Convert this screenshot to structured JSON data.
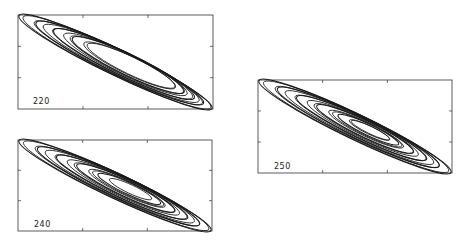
{
  "chart_data": [
    {
      "type": "line",
      "title": "",
      "label": "220",
      "description": "Phase-plane trajectory spiralling inward along a tilted elliptical band (upper-left to lower-right)",
      "xlabel": "",
      "ylabel": "",
      "grid": false,
      "frame": {
        "x": 18,
        "y": 15,
        "w": 195,
        "h": 94
      },
      "loops": 12,
      "inner_loop_fraction": 0.45
    },
    {
      "type": "line",
      "title": "",
      "label": "240",
      "description": "Phase-plane trajectory with nested tilted elliptical loops, tighter core",
      "xlabel": "",
      "ylabel": "",
      "grid": false,
      "frame": {
        "x": 18,
        "y": 140,
        "w": 194,
        "h": 91
      },
      "loops": 14,
      "inner_loop_fraction": 0.25
    },
    {
      "type": "line",
      "title": "",
      "label": "250",
      "description": "Phase-plane trajectory with nested tilted elliptical loops converging to a small central cycle",
      "xlabel": "",
      "ylabel": "",
      "grid": false,
      "frame": {
        "x": 258,
        "y": 80,
        "w": 194,
        "h": 93
      },
      "loops": 15,
      "inner_loop_fraction": 0.18
    }
  ],
  "panels": {
    "p220": {
      "label": "220"
    },
    "p240": {
      "label": "240"
    },
    "p250": {
      "label": "250"
    }
  }
}
